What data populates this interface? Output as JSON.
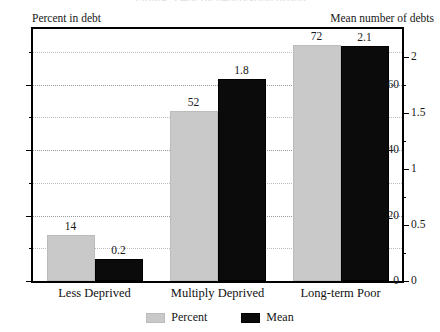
{
  "clipped_title": "Figure: Debt by deprivation group",
  "axes": {
    "left_caption": "Percent in debt",
    "right_caption": "Mean number of debts",
    "left_ticks": [
      "0",
      "20",
      "40",
      "60"
    ],
    "right_ticks": [
      "0",
      "0.5",
      "1",
      "1.5",
      "2"
    ]
  },
  "legend": {
    "items": [
      {
        "label": "Percent",
        "color": "#c9c9c9"
      },
      {
        "label": "Mean",
        "color": "#0b0b0b"
      }
    ]
  },
  "chart_data": {
    "type": "bar",
    "title": "",
    "categories": [
      "Less Deprived",
      "Multiply Deprived",
      "Long-term Poor"
    ],
    "series": [
      {
        "name": "Percent",
        "axis": "left",
        "color": "#c9c9c9",
        "values": [
          14,
          52,
          72
        ],
        "labels": [
          "14",
          "52",
          "72"
        ]
      },
      {
        "name": "Mean",
        "axis": "right",
        "color": "#0b0b0b",
        "values": [
          0.2,
          1.8,
          2.1
        ],
        "labels": [
          "0.2",
          "1.8",
          "2.1"
        ]
      }
    ],
    "xlabel": "",
    "ylabel": "Percent in debt",
    "y2label": "Mean number of debts",
    "ylim": [
      0,
      77
    ],
    "y2lim": [
      0,
      2.25
    ],
    "yticks": [
      0,
      20,
      40,
      60
    ],
    "y2ticks": [
      0,
      0.5,
      1,
      1.5,
      2
    ],
    "grid": true,
    "legend_position": "bottom"
  }
}
